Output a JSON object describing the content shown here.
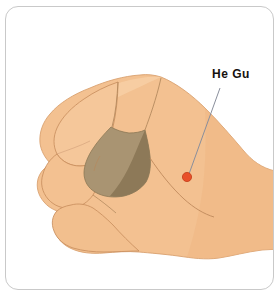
{
  "figure": {
    "kind": "anatomical-illustration",
    "frame": {
      "border_color": "#c9c9c9",
      "background_color": "#ffffff",
      "corner_radius_px": 13
    }
  },
  "annotation": {
    "label": "He Gu",
    "label_color": "#15120f",
    "leader_line_color": "#8a8f9c",
    "point_marker": {
      "name": "acupoint-marker",
      "color": "#e8502a",
      "outline_color": "#c23c18",
      "center_x": 187,
      "center_y": 177,
      "diameter_px": 9
    }
  },
  "palette": {
    "skin_light": "#f7cfa4",
    "skin_base": "#f3c191",
    "skin_mid": "#eeb684",
    "skin_shadow_edge": "#e5a877",
    "web_space_light": "#a99472",
    "web_space_dark": "#8d7958",
    "crease_line": "#9c7a55",
    "outline": "#c98f5e"
  }
}
